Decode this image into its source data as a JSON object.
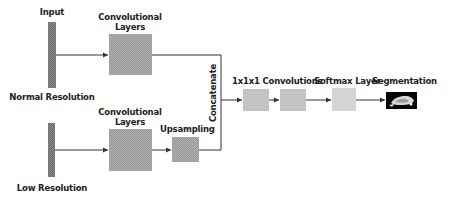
{
  "diagram": {
    "inputs": {
      "title": "Input",
      "normal_label": "Normal Resolution",
      "low_label": "Low Resolution"
    },
    "top_branch": {
      "conv_label_line1": "Convolutional",
      "conv_label_line2": "Layers"
    },
    "bottom_branch": {
      "conv_label_line1": "Convolutional",
      "conv_label_line2": "Layers",
      "upsampling_label": "Upsampling"
    },
    "merge": {
      "label": "Concatenate"
    },
    "head": {
      "conv1x1_label": "1x1x1 Convolutions",
      "softmax_label": "Softmax Layer",
      "output_label": "Segmentation"
    },
    "colors": {
      "line": "#333333",
      "input_bar": "#6e6e6e",
      "conv_box": "#9a9a9a",
      "small_box": "#bdbdbd",
      "softmax_box": "#cfcfcf",
      "segmentation_bg": "#050505"
    }
  }
}
